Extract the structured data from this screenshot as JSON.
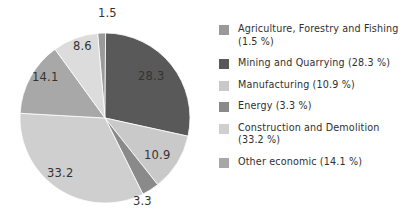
{
  "chart_data": {
    "type": "pie",
    "title": "",
    "subtitle": "",
    "xlabel": "",
    "ylabel": "",
    "legend_position": "right",
    "grid": false,
    "unit": "%",
    "start_angle_deg": -5,
    "direction": "clockwise",
    "categories": [
      "Agriculture, Forestry and Fishing",
      "Mining and Quarrying",
      "Manufacturing",
      "Energy",
      "Construction and Demolition",
      "Other economic",
      "Unlabelled"
    ],
    "values": [
      1.5,
      28.3,
      10.9,
      3.3,
      33.2,
      14.1,
      8.6
    ],
    "colors": [
      "#9a9a9a",
      "#595959",
      "#c9c9c9",
      "#8a8a8a",
      "#cfcfcf",
      "#a8a8a8",
      "#dcdcdc"
    ],
    "slices": [
      {
        "name": "Agriculture, Forestry and Fishing",
        "value": 1.5,
        "label": "1.5",
        "color": "#9a9a9a",
        "in_legend": true
      },
      {
        "name": "Mining and Quarrying",
        "value": 28.3,
        "label": "28.3",
        "color": "#595959",
        "in_legend": true
      },
      {
        "name": "Manufacturing",
        "value": 10.9,
        "label": "10.9",
        "color": "#c9c9c9",
        "in_legend": true
      },
      {
        "name": "Energy",
        "value": 3.3,
        "label": "3.3",
        "color": "#8a8a8a",
        "in_legend": true
      },
      {
        "name": "Construction and Demolition",
        "value": 33.2,
        "label": "33.2",
        "color": "#cfcfcf",
        "in_legend": true
      },
      {
        "name": "Other economic",
        "value": 14.1,
        "label": "14.1",
        "color": "#a8a8a8",
        "in_legend": true
      },
      {
        "name": "Unlabelled",
        "value": 8.6,
        "label": "8.6",
        "color": "#dcdcdc",
        "in_legend": false
      }
    ],
    "slice_labels": [
      "1.5",
      "28.3",
      "10.9",
      "3.3",
      "33.2",
      "14.1",
      "8.6"
    ]
  },
  "pie": {
    "labels": {
      "agriculture": "1.5",
      "mining": "28.3",
      "manufacturing": "10.9",
      "energy": "3.3",
      "construction": "33.2",
      "other": "14.1",
      "unlabelled": "8.6"
    }
  },
  "legend": {
    "items": [
      {
        "label": "Agriculture, Forestry and Fishing (1.5 %)",
        "color": "#9a9a9a"
      },
      {
        "label": "Mining and Quarrying (28.3 %)",
        "color": "#595959"
      },
      {
        "label": "Manufacturing (10.9 %)",
        "color": "#c9c9c9"
      },
      {
        "label": "Energy (3.3 %)",
        "color": "#8a8a8a"
      },
      {
        "label": "Construction and Demolition (33.2 %)",
        "color": "#cfcfcf"
      },
      {
        "label": "Other economic (14.1 %)",
        "color": "#a8a8a8"
      }
    ]
  }
}
